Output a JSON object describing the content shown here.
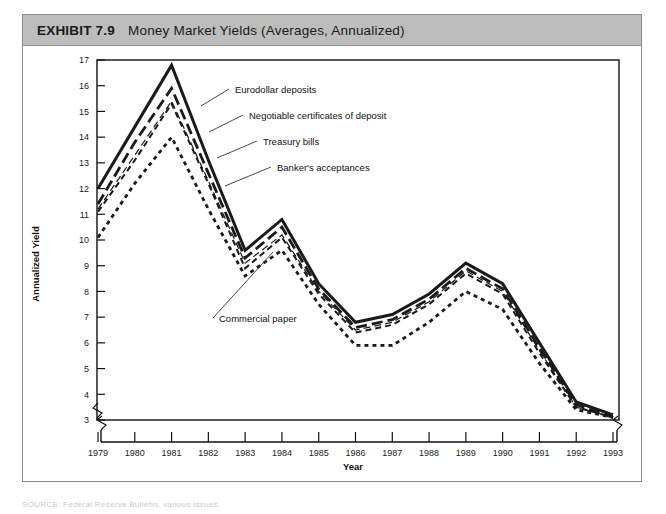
{
  "exhibit": {
    "number": "EXHIBIT 7.9",
    "title": "Money Market Yields (Averages, Annualized)"
  },
  "axis": {
    "y_title": "Annualized Yield",
    "x_title": "Year"
  },
  "chart_data": {
    "type": "line",
    "title": "Money Market Yields (Averages, Annualized)",
    "xlabel": "Year",
    "ylabel": "Annualized Yield",
    "x": [
      1979,
      1980,
      1981,
      1982,
      1983,
      1984,
      1985,
      1986,
      1987,
      1988,
      1989,
      1990,
      1991,
      1992,
      1993
    ],
    "xticklabels": [
      "1979",
      "1980",
      "1981",
      "1982",
      "1983",
      "1984",
      "1985",
      "1986",
      "1987",
      "1988",
      "1989",
      "1990",
      "1991",
      "1992",
      "1993"
    ],
    "ylim": [
      3,
      17
    ],
    "yticks": [
      3,
      4,
      5,
      6,
      7,
      8,
      9,
      10,
      11,
      12,
      13,
      14,
      15,
      16,
      17
    ],
    "yticklabels": [
      "3",
      "4",
      "5",
      "6",
      "7",
      "8",
      "9",
      "10",
      "11",
      "12",
      "13",
      "14",
      "15",
      "16",
      "17"
    ],
    "axis_break_x": true,
    "axis_break_y": true,
    "grid": false,
    "legend": "inline-annotations",
    "series": [
      {
        "name": "Eurodollar deposits",
        "style": "solid",
        "values": [
          12.0,
          14.4,
          16.8,
          13.1,
          9.6,
          10.8,
          8.3,
          6.8,
          7.1,
          7.9,
          9.1,
          8.3,
          6.0,
          3.7,
          3.2
        ]
      },
      {
        "name": "Negotiable certificates of deposit",
        "style": "long-dash",
        "values": [
          11.4,
          13.8,
          15.9,
          12.6,
          9.3,
          10.5,
          8.1,
          6.6,
          6.9,
          7.7,
          8.9,
          8.1,
          5.8,
          3.6,
          3.1
        ]
      },
      {
        "name": "Treasury bills",
        "style": "thin-dash",
        "values": [
          11.2,
          13.3,
          15.4,
          12.3,
          9.1,
          10.2,
          8.0,
          6.5,
          6.8,
          7.6,
          8.8,
          8.0,
          5.7,
          3.5,
          3.1
        ]
      },
      {
        "name": "Banker's acceptances",
        "style": "medium-dash",
        "values": [
          11.1,
          13.1,
          15.3,
          12.2,
          8.9,
          10.1,
          7.9,
          6.4,
          6.7,
          7.5,
          8.7,
          7.9,
          5.6,
          3.5,
          3.1
        ]
      },
      {
        "name": "Commercial paper",
        "style": "dotted",
        "values": [
          10.1,
          12.2,
          14.0,
          11.2,
          8.6,
          9.6,
          7.5,
          5.9,
          5.9,
          6.8,
          8.0,
          7.3,
          5.2,
          3.4,
          3.1
        ]
      }
    ],
    "annotations": [
      {
        "text": "Eurodollar deposits",
        "series": "Eurodollar deposits"
      },
      {
        "text": "Negotiable certificates of deposit",
        "series": "Negotiable certificates of deposit"
      },
      {
        "text": "Treasury bills",
        "series": "Treasury bills"
      },
      {
        "text": "Banker's acceptances",
        "series": "Banker's acceptances"
      },
      {
        "text": "Commercial paper",
        "series": "Commercial paper"
      }
    ]
  },
  "footer": {
    "credit": "SOURCE: Federal Reserve Bulletin, various issues."
  }
}
